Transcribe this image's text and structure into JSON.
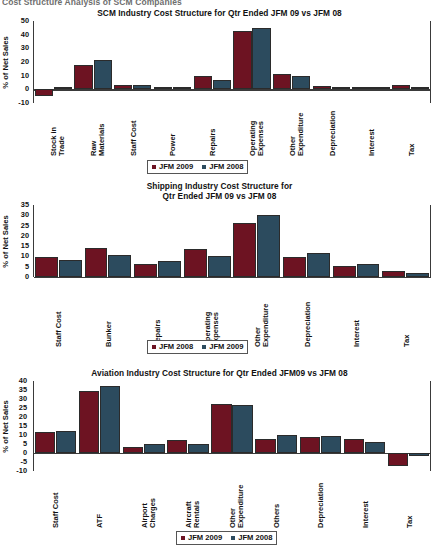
{
  "document": {
    "header_title": "Cost Structure Analysis of SCM Companies"
  },
  "charts": [
    {
      "title_line1": "SCM Industry Cost Structure for Qtr Ended JFM 09 vs JFM 08",
      "title_line2": "",
      "ylabel": "% of Net Sales",
      "legend": [
        {
          "label": "JFM 2009",
          "color": "#6d1322"
        },
        {
          "label": "JFM 2008",
          "color": "#2c4b5e"
        }
      ],
      "chart_data": {
        "type": "bar",
        "title": "SCM Industry Cost Structure for Qtr Ended JFM 09 vs JFM 08",
        "xlabel": "",
        "ylabel": "% of Net Sales",
        "ylim": [
          -10,
          50
        ],
        "yticks": [
          -10,
          0,
          10,
          20,
          30,
          40,
          50
        ],
        "grid": false,
        "legend_position": "bottom",
        "categories": [
          "Stock in\nTrade",
          "Raw\nMaterials",
          "Staff Cost",
          "Power",
          "Repairs",
          "Operating\nExpenses",
          "Other\nExpenditure",
          "Depreciation",
          "Interest",
          "Tax"
        ],
        "series": [
          {
            "name": "JFM 2009",
            "color": "#6d1322",
            "values": [
              -5.0,
              18.0,
              3.0,
              0.2,
              9.5,
              43.0,
              11.5,
              2.5,
              0.6,
              3.0
            ]
          },
          {
            "name": "JFM 2008",
            "color": "#2c4b5e",
            "values": [
              0.0,
              21.5,
              3.2,
              0.2,
              7.0,
              45.0,
              10.0,
              1.2,
              0.5,
              2.0
            ]
          }
        ]
      }
    },
    {
      "title_line1": "Shipping Industry Cost Structure for",
      "title_line2": "Qtr Ended JFM 09 vs JFM 08",
      "ylabel": "% of Net Sales",
      "legend": [
        {
          "label": "JFM 2008",
          "color": "#6d1322"
        },
        {
          "label": "JFM 2009",
          "color": "#2c4b5e"
        }
      ],
      "chart_data": {
        "type": "bar",
        "title": "Shipping Industry Cost Structure for Qtr Ended JFM 09 vs JFM 08",
        "xlabel": "",
        "ylabel": "% of Net Sales",
        "ylim": [
          0,
          35
        ],
        "yticks": [
          0,
          5,
          10,
          15,
          20,
          25,
          30,
          35
        ],
        "grid": false,
        "legend_position": "bottom",
        "categories": [
          "Staff Cost",
          "Bunker",
          "Repairs",
          "Operating\nExpenses",
          "Other\nExpenditure",
          "Depreciation",
          "Interest",
          "Tax"
        ],
        "series": [
          {
            "name": "JFM 2008",
            "color": "#6d1322",
            "values": [
              9.5,
              14.0,
              6.5,
              13.5,
              26.5,
              9.5,
              5.5,
              3.0
            ]
          },
          {
            "name": "JFM 2009",
            "color": "#2c4b5e",
            "values": [
              8.5,
              10.5,
              8.0,
              10.0,
              30.0,
              11.5,
              6.5,
              2.0
            ]
          }
        ]
      }
    },
    {
      "title_line1": "Aviation Industry Cost Structure for Qtr Ended JFM09 vs JFM 08",
      "title_line2": "",
      "ylabel": "% of Net Sales",
      "legend": [
        {
          "label": "JFM 2009",
          "color": "#6d1322"
        },
        {
          "label": "JFM 2008",
          "color": "#2c4b5e"
        }
      ],
      "chart_data": {
        "type": "bar",
        "title": "Aviation Industry Cost Structure for Qtr Ended JFM09 vs JFM 08",
        "xlabel": "",
        "ylabel": "% of Net Sales",
        "ylim": [
          -10,
          40
        ],
        "yticks": [
          -10,
          -5,
          0,
          5,
          10,
          15,
          20,
          25,
          30,
          35,
          40
        ],
        "grid": false,
        "legend_position": "bottom",
        "categories": [
          "Staff Cost",
          "ATF",
          "Airport\nCharges",
          "Aircraft\nRentals",
          "Other\nExpenditure",
          "Others",
          "Depreciation",
          "Interest",
          "Tax"
        ],
        "series": [
          {
            "name": "JFM 2009",
            "color": "#6d1322",
            "values": [
              11.5,
              34.5,
              3.5,
              7.0,
              27.0,
              8.0,
              9.0,
              8.0,
              -7.0
            ]
          },
          {
            "name": "JFM 2008",
            "color": "#2c4b5e",
            "values": [
              12.0,
              37.0,
              5.0,
              5.0,
              26.5,
              10.0,
              9.5,
              6.0,
              -1.5
            ]
          }
        ]
      }
    }
  ]
}
